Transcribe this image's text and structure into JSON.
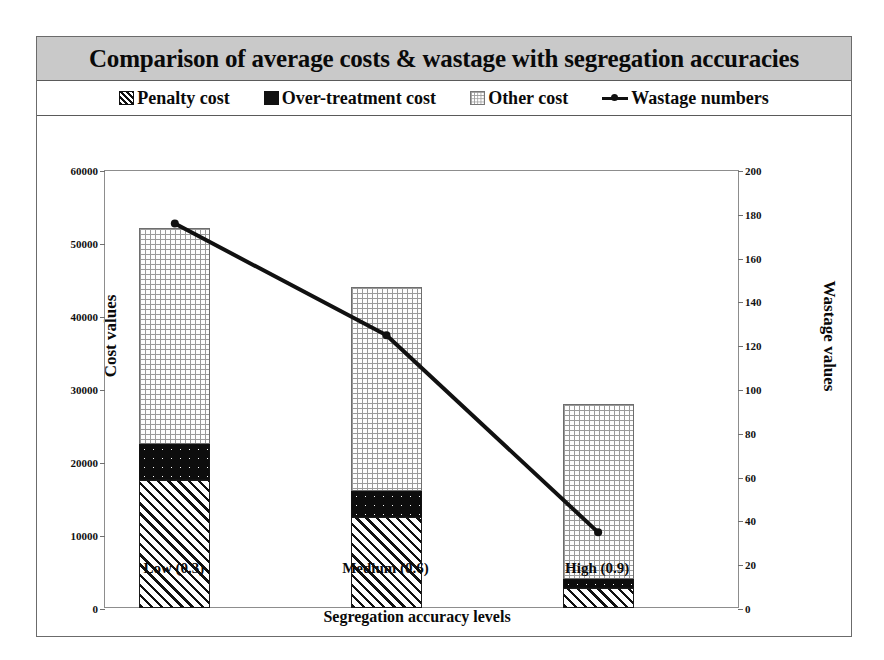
{
  "chart": {
    "title": "Comparison of average costs & wastage with segregation accuracies",
    "legend": [
      {
        "label": "Penalty cost",
        "swatch": "hatch-square-icon"
      },
      {
        "label": "Over-treatment cost",
        "swatch": "black-dotted-square-icon"
      },
      {
        "label": "Other cost",
        "swatch": "grid-square-icon"
      },
      {
        "label": "Wastage numbers",
        "swatch": "line-marker-icon"
      }
    ]
  },
  "chart_data": {
    "type": "bar",
    "title": "Comparison of average costs & wastage with segregation accuracies",
    "xlabel": "Segregation accuracy levels",
    "ylabel": "Cost values",
    "y2label": "Wastage values",
    "categories": [
      "Low (0.3)",
      "Medium (0.6)",
      "High (0.9)"
    ],
    "stacked": true,
    "grid": false,
    "legend_position": "top",
    "ylim": [
      0,
      60000
    ],
    "yticks": [
      0,
      10000,
      20000,
      30000,
      40000,
      50000,
      60000
    ],
    "ytick_labels": [
      "0",
      "10000",
      "20000",
      "30000",
      "40000",
      "50000",
      "60000"
    ],
    "y2lim": [
      0,
      200
    ],
    "y2ticks": [
      0,
      20,
      40,
      60,
      80,
      100,
      120,
      140,
      160,
      180,
      200
    ],
    "y2tick_labels": [
      "0",
      "20",
      "40",
      "60",
      "80",
      "100",
      "120",
      "140",
      "160",
      "180",
      "200"
    ],
    "series": [
      {
        "name": "Penalty cost",
        "axis": "left",
        "kind": "bar",
        "values": [
          17500,
          12500,
          2800
        ]
      },
      {
        "name": "Over-treatment cost",
        "axis": "left",
        "kind": "bar",
        "values": [
          5000,
          3500,
          1200
        ]
      },
      {
        "name": "Other cost",
        "axis": "left",
        "kind": "bar",
        "values": [
          29500,
          28000,
          24000
        ]
      },
      {
        "name": "Wastage numbers",
        "axis": "right",
        "kind": "line",
        "values": [
          176,
          125,
          35
        ]
      }
    ],
    "totals": [
      52000,
      44000,
      28000
    ]
  }
}
